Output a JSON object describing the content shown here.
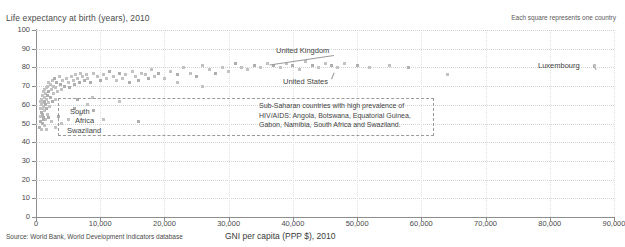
{
  "notes": {
    "legend": "Each square represents one country",
    "source": "Source: World Bank, World Development Indicators database"
  },
  "chart_data": {
    "type": "scatter",
    "title": "",
    "ylabel": "Life expectancy at birth (years), 2010",
    "xlabel": "GNI per capita (PPP $), 2010",
    "xlim": [
      0,
      90000
    ],
    "ylim": [
      0,
      100
    ],
    "grid": true,
    "legend_position": "top-right",
    "x_ticks": [
      "0",
      "10,000",
      "20,000",
      "30,000",
      "40,000",
      "50,000",
      "60,000",
      "70,000",
      "80,000",
      "90,000"
    ],
    "x_tick_values": [
      0,
      10000,
      20000,
      30000,
      40000,
      50000,
      60000,
      70000,
      80000,
      90000
    ],
    "y_ticks": [
      "0",
      "10",
      "20",
      "30",
      "40",
      "50",
      "60",
      "70",
      "80",
      "90",
      "100"
    ],
    "y_tick_values": [
      0,
      10,
      20,
      30,
      40,
      50,
      60,
      70,
      80,
      90,
      100
    ],
    "marker": "square",
    "marker_color": "#c2c2c2",
    "points": [
      [
        600,
        48
      ],
      [
        650,
        54
      ],
      [
        700,
        58
      ],
      [
        720,
        51
      ],
      [
        760,
        62
      ],
      [
        800,
        47
      ],
      [
        820,
        56
      ],
      [
        860,
        60
      ],
      [
        900,
        63
      ],
      [
        950,
        50
      ],
      [
        980,
        58
      ],
      [
        1000,
        65
      ],
      [
        1050,
        55
      ],
      [
        1080,
        61
      ],
      [
        1100,
        67
      ],
      [
        1150,
        53
      ],
      [
        1200,
        59
      ],
      [
        1250,
        64
      ],
      [
        1280,
        49
      ],
      [
        1300,
        68
      ],
      [
        1350,
        57
      ],
      [
        1400,
        62
      ],
      [
        1450,
        66
      ],
      [
        1500,
        52
      ],
      [
        1550,
        60
      ],
      [
        1600,
        69
      ],
      [
        1650,
        63
      ],
      [
        1700,
        58
      ],
      [
        1750,
        70
      ],
      [
        1800,
        55
      ],
      [
        1850,
        65
      ],
      [
        1900,
        61
      ],
      [
        1950,
        72
      ],
      [
        2000,
        67
      ],
      [
        2100,
        59
      ],
      [
        2200,
        71
      ],
      [
        2300,
        64
      ],
      [
        2400,
        68
      ],
      [
        2500,
        73
      ],
      [
        2600,
        62
      ],
      [
        2700,
        70
      ],
      [
        2800,
        66
      ],
      [
        2900,
        74
      ],
      [
        3000,
        69
      ],
      [
        3100,
        63
      ],
      [
        3200,
        72
      ],
      [
        3400,
        67
      ],
      [
        3600,
        75
      ],
      [
        3800,
        71
      ],
      [
        4000,
        68
      ],
      [
        4200,
        73
      ],
      [
        4500,
        70
      ],
      [
        4800,
        74
      ],
      [
        5000,
        72
      ],
      [
        5200,
        69
      ],
      [
        5500,
        75
      ],
      [
        5800,
        73
      ],
      [
        6000,
        71
      ],
      [
        6200,
        76
      ],
      [
        6500,
        74
      ],
      [
        6800,
        72
      ],
      [
        7000,
        77
      ],
      [
        7200,
        75
      ],
      [
        7500,
        73
      ],
      [
        7800,
        76
      ],
      [
        8000,
        74
      ],
      [
        8500,
        72
      ],
      [
        9000,
        77
      ],
      [
        9500,
        75
      ],
      [
        10000,
        73
      ],
      [
        10500,
        76
      ],
      [
        11000,
        74
      ],
      [
        11500,
        78
      ],
      [
        12000,
        75
      ],
      [
        12500,
        73
      ],
      [
        13000,
        77
      ],
      [
        13500,
        74
      ],
      [
        14000,
        76
      ],
      [
        14500,
        72
      ],
      [
        15000,
        78
      ],
      [
        15500,
        75
      ],
      [
        16000,
        73
      ],
      [
        16500,
        77
      ],
      [
        17000,
        76
      ],
      [
        17500,
        74
      ],
      [
        18000,
        79
      ],
      [
        18500,
        75
      ],
      [
        19000,
        77
      ],
      [
        20000,
        74
      ],
      [
        21000,
        78
      ],
      [
        22000,
        76
      ],
      [
        23000,
        80
      ],
      [
        24000,
        77
      ],
      [
        25000,
        75
      ],
      [
        26000,
        81
      ],
      [
        27000,
        79
      ],
      [
        28000,
        77
      ],
      [
        29000,
        80
      ],
      [
        30000,
        78
      ],
      [
        31000,
        82
      ],
      [
        32000,
        80
      ],
      [
        33000,
        79
      ],
      [
        34000,
        81
      ],
      [
        35000,
        80
      ],
      [
        36000,
        82
      ],
      [
        37000,
        81
      ],
      [
        38000,
        80
      ],
      [
        39000,
        82
      ],
      [
        40000,
        81
      ],
      [
        41000,
        79
      ],
      [
        42000,
        83
      ],
      [
        43000,
        81
      ],
      [
        44000,
        80
      ],
      [
        45000,
        82
      ],
      [
        46000,
        81
      ],
      [
        47000,
        80
      ],
      [
        48000,
        82
      ],
      [
        50000,
        81
      ],
      [
        52000,
        80
      ],
      [
        55000,
        81
      ],
      [
        58000,
        80
      ],
      [
        64000,
        76
      ],
      [
        87000,
        81
      ],
      [
        1200,
        52
      ],
      [
        1400,
        49
      ],
      [
        1600,
        47
      ],
      [
        2000,
        53
      ],
      [
        2400,
        51
      ],
      [
        3000,
        48
      ],
      [
        3500,
        54
      ],
      [
        4000,
        50
      ],
      [
        5000,
        52
      ],
      [
        6000,
        58
      ],
      [
        7000,
        55
      ],
      [
        8000,
        60
      ],
      [
        9000,
        57
      ],
      [
        10500,
        52
      ],
      [
        13000,
        62
      ],
      [
        16000,
        51
      ],
      [
        22000,
        72
      ],
      [
        26000,
        70
      ],
      [
        6500,
        63
      ],
      [
        8800,
        64
      ]
    ],
    "annotations": [
      {
        "name": "united-kingdom",
        "label": "United Kingdom",
        "x": 36000,
        "y": 80.5,
        "label_x": 276,
        "label_y": 46
      },
      {
        "name": "united-states",
        "label": "United States",
        "x": 47000,
        "y": 78.5,
        "label_x": 283,
        "label_y": 77
      },
      {
        "name": "luxembourg",
        "label": "Luxembourg",
        "x": 87000,
        "y": 81,
        "label_x": 538,
        "label_y": 61
      },
      {
        "name": "south-africa",
        "label": "South\nAfrica",
        "x": 10500,
        "y": 52,
        "label_x": 70,
        "label_y": 107
      },
      {
        "name": "swaziland",
        "label": "Swaziland",
        "x": 5000,
        "y": 48,
        "label_x": 67,
        "label_y": 126
      }
    ],
    "callout": {
      "text_line_1": "Sub-Saharan countries with high prevalence of",
      "text_line_2": "HIV/AIDS: Angola, Botswana, Equatorial Guinea,",
      "text_line_3": "Gabon, Namibia, South Africa and Swaziland."
    },
    "south_africa_label_line_1": "South",
    "south_africa_label_line_2": "Africa",
    "swaziland_label": "Swaziland"
  }
}
